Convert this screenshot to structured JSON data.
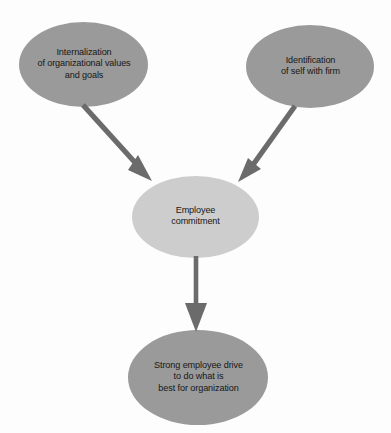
{
  "diagram": {
    "type": "flowchart",
    "background_color": "#fdfdfd",
    "palette": {
      "node_fill_dark": "#9a9a9a",
      "node_fill_light": "#cdcdcd",
      "arrow_color": "#6b6b6b",
      "text_color": "#171717"
    },
    "nodes": [
      {
        "id": "internalization",
        "shape": "ellipse",
        "fill": "#9a9a9a",
        "lines": [
          "Internalization",
          "of organizational values",
          "and goals"
        ]
      },
      {
        "id": "identification",
        "shape": "ellipse",
        "fill": "#9a9a9a",
        "lines": [
          "Identification",
          "of self with firm"
        ]
      },
      {
        "id": "commitment",
        "shape": "ellipse",
        "fill": "#cdcdcd",
        "lines": [
          "Employee",
          "commitment"
        ]
      },
      {
        "id": "drive",
        "shape": "ellipse",
        "fill": "#9a9a9a",
        "lines": [
          "Strong employee drive",
          "to do what is",
          "best for organization"
        ]
      }
    ],
    "edges": [
      {
        "id": "edge-internalization-to-commitment",
        "from": "internalization",
        "to": "commitment",
        "style": "solid-arrow",
        "color": "#6b6b6b"
      },
      {
        "id": "edge-identification-to-commitment",
        "from": "identification",
        "to": "commitment",
        "style": "solid-arrow",
        "color": "#6b6b6b"
      },
      {
        "id": "edge-commitment-to-drive",
        "from": "commitment",
        "to": "drive",
        "style": "solid-arrow",
        "color": "#6b6b6b"
      }
    ]
  },
  "labels": {
    "internalization": {
      "line1": "Internalization",
      "line2": "of organizational values",
      "line3": "and goals"
    },
    "identification": {
      "line1": "Identification",
      "line2": "of self with firm"
    },
    "commitment": {
      "line1": "Employee",
      "line2": "commitment"
    },
    "drive": {
      "line1": "Strong employee drive",
      "line2": "to do what is",
      "line3": "best for organization"
    }
  }
}
